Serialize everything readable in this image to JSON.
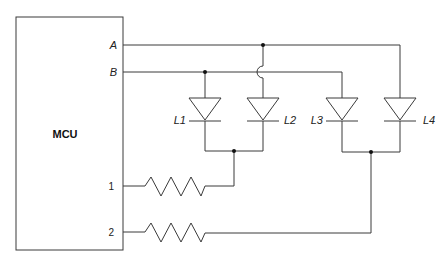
{
  "diagram": {
    "type": "circuit-schematic",
    "mcu": {
      "label": "MCU",
      "pins": {
        "A": "A",
        "B": "B",
        "p1": "1",
        "p2": "2"
      }
    },
    "leds": [
      {
        "label": "L1",
        "anode_net": "B",
        "cathode_net": "pin1"
      },
      {
        "label": "L2",
        "anode_net": "A",
        "cathode_net": "pin1"
      },
      {
        "label": "L3",
        "anode_net": "B",
        "cathode_net": "pin2"
      },
      {
        "label": "L4",
        "anode_net": "A",
        "cathode_net": "pin2"
      }
    ],
    "resistors": [
      {
        "name": "R1",
        "from": "pin1",
        "to": "L1/L2 cathodes"
      },
      {
        "name": "R2",
        "from": "pin2",
        "to": "L3/L4 cathodes"
      }
    ],
    "colors": {
      "wire": "#3a3a3a",
      "background": "#ffffff"
    }
  }
}
